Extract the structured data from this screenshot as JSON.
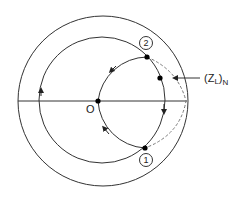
{
  "diagram": {
    "labels": {
      "origin": "O",
      "point1": "1",
      "point2": "2",
      "load_impedance_main": "(Z",
      "load_impedance_sub": "L",
      "load_impedance_close": ")",
      "load_impedance_norm": "N"
    },
    "colors": {
      "stroke": "#333333",
      "dashed": "#777777",
      "background": "#ffffff"
    }
  }
}
